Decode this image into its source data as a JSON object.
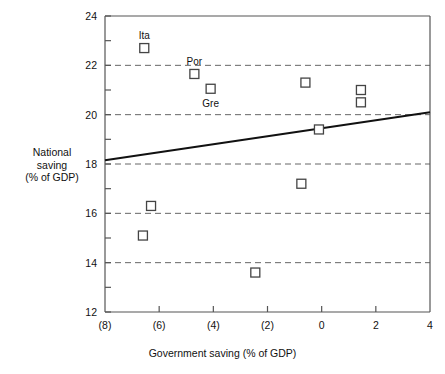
{
  "chart_data": {
    "type": "scatter",
    "title": "",
    "xlabel": "Government saving (% of GDP)",
    "ylabel_lines": [
      "National",
      "saving",
      "(% of GDP)"
    ],
    "ylabel": "National saving (% of GDP)",
    "xlim": [
      -8,
      4
    ],
    "ylim": [
      12,
      24
    ],
    "xticks": [
      -8,
      -6,
      -4,
      -2,
      0,
      2,
      4
    ],
    "xticklabels": [
      "(8)",
      "(6)",
      "(4)",
      "(2)",
      "0",
      "2",
      "4"
    ],
    "yticks": [
      12,
      14,
      16,
      18,
      20,
      22,
      24
    ],
    "yticklabels": [
      "12",
      "14",
      "16",
      "18",
      "20",
      "22",
      "24"
    ],
    "y_minor_ticks": [
      13,
      15,
      17,
      19,
      21,
      23
    ],
    "gridlines_y": [
      14,
      16,
      18,
      20,
      22
    ],
    "grid": "horizontal-dashed",
    "legend": "none",
    "marker": "open-square",
    "points": [
      {
        "x": -6.55,
        "y": 22.7,
        "label": "Ita",
        "label_pos": "above"
      },
      {
        "x": -4.7,
        "y": 21.65,
        "label": "Por",
        "label_pos": "above"
      },
      {
        "x": -4.1,
        "y": 21.05,
        "label": "Gre",
        "label_pos": "below"
      },
      {
        "x": -0.6,
        "y": 21.3,
        "label": "",
        "label_pos": ""
      },
      {
        "x": 1.45,
        "y": 21.0,
        "label": "",
        "label_pos": ""
      },
      {
        "x": 1.45,
        "y": 20.5,
        "label": "",
        "label_pos": ""
      },
      {
        "x": -0.1,
        "y": 19.4,
        "label": "",
        "label_pos": ""
      },
      {
        "x": -0.75,
        "y": 17.2,
        "label": "",
        "label_pos": ""
      },
      {
        "x": -6.3,
        "y": 16.3,
        "label": "",
        "label_pos": ""
      },
      {
        "x": -6.6,
        "y": 15.1,
        "label": "",
        "label_pos": ""
      },
      {
        "x": -2.45,
        "y": 13.6,
        "label": "",
        "label_pos": ""
      }
    ],
    "trendline": {
      "x0": -8,
      "y0": 18.15,
      "x1": 4,
      "y1": 20.1,
      "style": "solid"
    },
    "colors": {
      "axis": "#555555",
      "grid": "#666666",
      "marker": "#444444",
      "trendline": "#111111",
      "text": "#111111"
    }
  }
}
